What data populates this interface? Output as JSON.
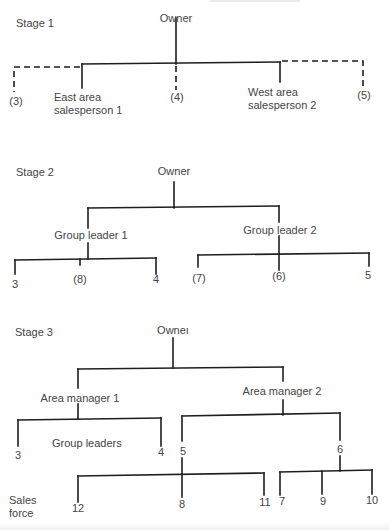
{
  "diagram": {
    "type": "organization-chart-evolution",
    "stages": [
      {
        "label": "Stage 1",
        "root": "Owner",
        "level1": [
          {
            "label": "(3)",
            "line": "dashed"
          },
          {
            "label": "East area\nsalesperson 1",
            "line": "solid"
          },
          {
            "label": "(4)",
            "line": "dashed"
          },
          {
            "label": "West area\nsalesperson 2",
            "line": "solid"
          },
          {
            "label": "(5)",
            "line": "dashed"
          }
        ]
      },
      {
        "label": "Stage 2",
        "root": "Owner",
        "level1": [
          {
            "label": "Group leader 1",
            "children": [
              "3",
              "(8)",
              "4"
            ]
          },
          {
            "label": "Group leader 2",
            "children": [
              "(7)",
              "(6)",
              "5"
            ]
          }
        ]
      },
      {
        "label": "Stage 3",
        "root": "Owneı",
        "level1": [
          {
            "label": "Area manager 1",
            "children": [
              {
                "label": "3"
              },
              {
                "label": "4"
              }
            ]
          },
          {
            "label": "Area manager 2",
            "children": [
              {
                "label": "5",
                "children": [
                  "12",
                  "8",
                  "11"
                ]
              },
              {
                "label": "6",
                "children": [
                  "7",
                  "9",
                  "10"
                ]
              }
            ]
          }
        ],
        "level_labels": {
          "group_leaders": "Group leaders",
          "sales_force": "Sales\nforce"
        }
      }
    ],
    "line_color": "#1e1e1e",
    "text_color": "#444444"
  }
}
